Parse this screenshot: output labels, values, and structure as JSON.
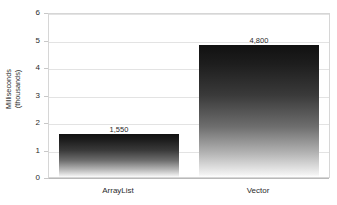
{
  "chart_data": {
    "type": "bar",
    "title": "",
    "subtitle": "",
    "xlabel": "",
    "ylabel": "Milliseconds (thousands)",
    "ylabel_line1": "Milliseconds",
    "ylabel_line2": "(thousands)",
    "categories": [
      "ArrayList",
      "Vector"
    ],
    "values": [
      1.55,
      4.8
    ],
    "data_labels": [
      "1,550",
      "4,800"
    ],
    "values_in_milliseconds": [
      1550,
      4800
    ],
    "ylim": [
      0,
      6
    ],
    "ytick_labels": [
      "0",
      "1",
      "2",
      "3",
      "4",
      "5",
      "6"
    ],
    "ytick_values": [
      0,
      1,
      2,
      3,
      4,
      5,
      6
    ],
    "grid": true,
    "grid_axis": "y",
    "legend": false,
    "legend_position": "none",
    "bar_fill": "vertical-gradient-black-to-white",
    "colors": {
      "bar_top": "#111111",
      "bar_bottom": "#ffffff",
      "gridline": "#e3e3e3",
      "axis": "#d6d6d6",
      "text": "#2b2b2b",
      "background": "#ffffff"
    }
  }
}
